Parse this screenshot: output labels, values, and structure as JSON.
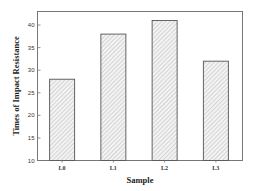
{
  "chart_data": {
    "type": "bar",
    "title": "",
    "xlabel": "Sample",
    "ylabel": "Times of Impact Resistance",
    "categories": [
      "L0",
      "L1",
      "L2",
      "L3"
    ],
    "values": [
      28,
      38,
      41,
      32
    ],
    "ylim": [
      10,
      43
    ],
    "yticks": [
      10,
      15,
      20,
      25,
      30,
      35,
      40
    ],
    "grid": false,
    "legend": null,
    "bar_fill": "hatched light gray",
    "bar_edge_color": "#555555"
  }
}
